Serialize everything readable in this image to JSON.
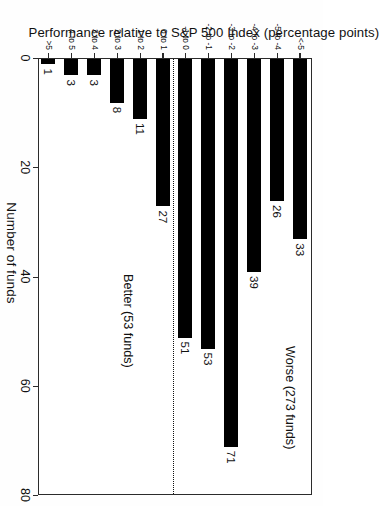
{
  "chart_data": {
    "type": "bar",
    "orientation": "horizontal",
    "title": "",
    "xlabel": "Number of funds",
    "ylabel": "Performance relative to S&P 500 Index (percentage points)",
    "xlim": [
      0,
      80
    ],
    "xticks": [
      0,
      20,
      40,
      60,
      80
    ],
    "xtick_labels": [
      "0",
      "20",
      "40",
      "60",
      "80"
    ],
    "grid": false,
    "legend": null,
    "bar_color": "#000000",
    "categories": [
      "<-5",
      "-5 to -4",
      "-4 to -3",
      "-3 to -2",
      "-2 to -1",
      "-1 to 0",
      "0 to 1",
      "1 to 2",
      "2 to 3",
      "3 to 4",
      "4 to 5",
      ">5"
    ],
    "values": [
      33,
      26,
      39,
      71,
      53,
      51,
      27,
      11,
      8,
      3,
      3,
      1
    ],
    "data_labels": [
      "33",
      "26",
      "39",
      "71",
      "53",
      "51",
      "27",
      "11",
      "8",
      "3",
      "3",
      "1"
    ],
    "annotations": [
      {
        "name": "worse-group",
        "text": "Worse (273 funds)",
        "total": 273,
        "covers_categories": [
          "<-5",
          "-5 to -4",
          "-4 to -3",
          "-3 to -2",
          "-2 to -1",
          "-1 to 0"
        ]
      },
      {
        "name": "better-group",
        "text": "Better (53 funds)",
        "total": 53,
        "covers_categories": [
          "0 to 1",
          "1 to 2",
          "2 to 3",
          "3 to 4",
          "4 to 5",
          ">5"
        ]
      }
    ],
    "divider": {
      "after_category": "-1 to 0",
      "style": "dotted",
      "color": "#111111"
    }
  }
}
